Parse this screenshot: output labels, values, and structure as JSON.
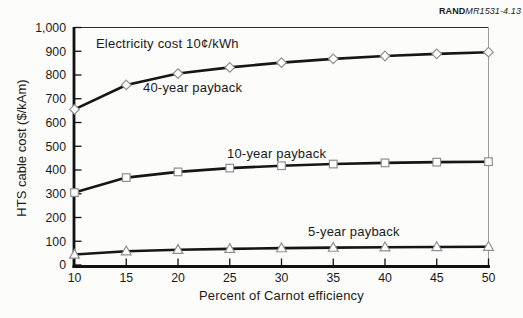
{
  "figure_label": {
    "brand": "RAND",
    "doc_ref": "MR1531-4.13"
  },
  "chart_data": {
    "type": "line",
    "annotation": "Electricity cost 10¢/kWh",
    "xlabel": "Percent of Carnot efficiency",
    "ylabel": "HTS cable cost ($/kAm)",
    "x": [
      10,
      15,
      20,
      25,
      30,
      35,
      40,
      45,
      50
    ],
    "x_ticks": [
      10,
      15,
      20,
      25,
      30,
      35,
      40,
      45,
      50
    ],
    "y_ticks": [
      0,
      100,
      200,
      300,
      400,
      500,
      600,
      700,
      800,
      900,
      1000
    ],
    "xlim": [
      10,
      50
    ],
    "ylim": [
      0,
      1000
    ],
    "grid": false,
    "legend": "inline labels next to each curve",
    "series": [
      {
        "name": "40-year payback",
        "marker": "diamond",
        "values": [
          655,
          758,
          806,
          832,
          852,
          868,
          880,
          889,
          896
        ]
      },
      {
        "name": "10-year payback",
        "marker": "square",
        "values": [
          305,
          368,
          392,
          408,
          418,
          425,
          430,
          433,
          435
        ]
      },
      {
        "name": "5-year payback",
        "marker": "triangle",
        "values": [
          44,
          58,
          64,
          68,
          71,
          73,
          75,
          76,
          77
        ]
      }
    ],
    "colors": {
      "line": "#161616",
      "marker_fill": "#ffffff",
      "marker_stroke": "#8f8f8f",
      "axis": "#111111",
      "border_top": "#2e2e2e",
      "border_right": "#9c9c9c",
      "text": "#1a1a1a",
      "background": "#fcfcfb"
    }
  }
}
